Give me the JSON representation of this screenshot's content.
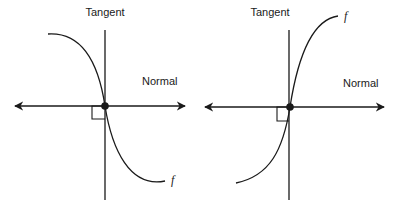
{
  "figure": {
    "panels": [
      {
        "id": "left",
        "tangent_label": "Tangent",
        "normal_label": "Normal",
        "function_label": "f",
        "curve_direction": "decreasing",
        "description": "Function f decreasing through the point; tangent line vertical, normal line horizontal with arrows, right-angle marker at intersection"
      },
      {
        "id": "right",
        "tangent_label": "Tangent",
        "normal_label": "Normal",
        "function_label": "f",
        "curve_direction": "increasing",
        "description": "Function f increasing through the point; tangent line vertical, normal line horizontal with arrows, right-angle marker at intersection"
      }
    ],
    "colors": {
      "stroke": "#1a1a1a",
      "background": "#ffffff"
    }
  }
}
